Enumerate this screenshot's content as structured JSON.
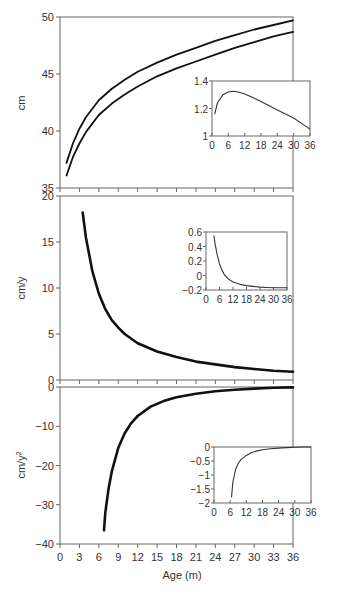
{
  "chart_data": [
    {
      "type": "line",
      "panel": "top",
      "ylabel": "cm",
      "xlabel": "",
      "ylim": [
        35,
        50
      ],
      "yticks": [
        35,
        40,
        45,
        50
      ],
      "xlim": [
        0,
        36
      ],
      "xticks": [
        0,
        3,
        6,
        9,
        12,
        15,
        18,
        21,
        24,
        27,
        30,
        33,
        36
      ],
      "series": [
        {
          "name": "upper",
          "x": [
            1,
            2,
            3,
            4,
            6,
            8,
            10,
            12,
            15,
            18,
            21,
            24,
            27,
            30,
            33,
            36
          ],
          "y": [
            37.2,
            38.9,
            40.2,
            41.2,
            42.7,
            43.7,
            44.5,
            45.2,
            46.0,
            46.7,
            47.3,
            47.9,
            48.4,
            48.9,
            49.3,
            49.7
          ]
        },
        {
          "name": "lower",
          "x": [
            1,
            2,
            3,
            4,
            6,
            8,
            10,
            12,
            15,
            18,
            21,
            24,
            27,
            30,
            33,
            36
          ],
          "y": [
            36.1,
            37.7,
            38.9,
            39.9,
            41.4,
            42.4,
            43.2,
            43.9,
            44.8,
            45.5,
            46.1,
            46.7,
            47.3,
            47.8,
            48.3,
            48.7
          ]
        }
      ],
      "inset": {
        "type": "line",
        "ylim": [
          1,
          1.4
        ],
        "yticks": [
          "1",
          "1.2",
          "1.4"
        ],
        "xlim": [
          0,
          36
        ],
        "xticks": [
          "0",
          "6",
          "12",
          "18",
          "24",
          "30",
          "36"
        ],
        "x": [
          1,
          2,
          4,
          6,
          8,
          10,
          12,
          15,
          18,
          21,
          24,
          27,
          30,
          33,
          36
        ],
        "y": [
          1.16,
          1.24,
          1.3,
          1.32,
          1.325,
          1.318,
          1.305,
          1.28,
          1.25,
          1.22,
          1.19,
          1.16,
          1.13,
          1.09,
          1.05
        ]
      }
    },
    {
      "type": "line",
      "panel": "middle",
      "ylabel": "cm/y",
      "xlabel": "",
      "ylim": [
        0,
        20
      ],
      "yticks": [
        0,
        5,
        10,
        15,
        20
      ],
      "xlim": [
        0,
        36
      ],
      "xticks": [
        0,
        3,
        6,
        9,
        12,
        15,
        18,
        21,
        24,
        27,
        30,
        33,
        36
      ],
      "series": [
        {
          "name": "velocity",
          "x": [
            3.5,
            4,
            5,
            6,
            7,
            8,
            9,
            10,
            12,
            15,
            18,
            21,
            24,
            27,
            30,
            33,
            36
          ],
          "y": [
            18.2,
            15.5,
            11.8,
            9.4,
            7.7,
            6.5,
            5.7,
            5.0,
            4.0,
            3.1,
            2.5,
            2.0,
            1.7,
            1.4,
            1.2,
            1.0,
            0.9
          ]
        }
      ],
      "inset": {
        "type": "line",
        "ylim": [
          -0.2,
          0.6
        ],
        "yticks": [
          "−0.2",
          "0",
          "0.2",
          "0.4",
          "0.6"
        ],
        "xlim": [
          0,
          36
        ],
        "xticks": [
          "0",
          "6",
          "12",
          "18",
          "24",
          "30",
          "36"
        ],
        "x": [
          3.5,
          4,
          5,
          6,
          7,
          8,
          10,
          12,
          15,
          18,
          21,
          24,
          27,
          30,
          33,
          36
        ],
        "y": [
          0.55,
          0.44,
          0.28,
          0.16,
          0.08,
          0.02,
          -0.05,
          -0.09,
          -0.12,
          -0.14,
          -0.15,
          -0.16,
          -0.165,
          -0.17,
          -0.17,
          -0.17
        ]
      }
    },
    {
      "type": "line",
      "panel": "bottom",
      "ylabel": "cm/y²",
      "xlabel": "Age (m)",
      "ylim": [
        -40,
        0
      ],
      "yticks": [
        -40,
        -30,
        -20,
        -10,
        0
      ],
      "xlim": [
        0,
        36
      ],
      "xticks": [
        0,
        3,
        6,
        9,
        12,
        15,
        18,
        21,
        24,
        27,
        30,
        33,
        36
      ],
      "series": [
        {
          "name": "acceleration",
          "x": [
            6.8,
            7,
            7.5,
            8,
            9,
            10,
            11,
            12,
            14,
            16,
            18,
            21,
            24,
            27,
            30,
            33,
            36
          ],
          "y": [
            -36.5,
            -32,
            -26,
            -21.5,
            -15.5,
            -11.8,
            -9.2,
            -7.4,
            -5.0,
            -3.6,
            -2.6,
            -1.7,
            -1.1,
            -0.7,
            -0.4,
            -0.2,
            -0.1
          ]
        }
      ],
      "inset": {
        "type": "line",
        "ylim": [
          -2,
          0
        ],
        "yticks": [
          "−2",
          "−1.5",
          "−1",
          "−0.5",
          "0"
        ],
        "xlim": [
          0,
          36
        ],
        "xticks": [
          "0",
          "6",
          "12",
          "18",
          "24",
          "30",
          "36"
        ],
        "x": [
          6.5,
          7,
          8,
          9,
          10,
          12,
          14,
          16,
          18,
          21,
          24,
          27,
          30,
          33,
          36
        ],
        "y": [
          -1.8,
          -1.25,
          -0.8,
          -0.58,
          -0.45,
          -0.3,
          -0.2,
          -0.14,
          -0.1,
          -0.06,
          -0.04,
          -0.02,
          -0.01,
          0,
          0
        ]
      }
    }
  ],
  "labels": {
    "top_ylabel": "cm",
    "middle_ylabel": "cm/y",
    "bottom_ylabel": "cm/y",
    "bottom_ylabel_sup": "2",
    "xlabel": "Age (m)"
  },
  "colors": {
    "axis": "#555555",
    "main_line": "#111111",
    "inset_line": "#333333",
    "text": "#333333"
  }
}
